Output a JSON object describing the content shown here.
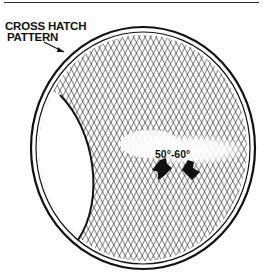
{
  "figure": {
    "callout_label_line1": "CROSS HATCH",
    "callout_label_line2": "PATTERN",
    "angle_label": "50°-60°"
  }
}
